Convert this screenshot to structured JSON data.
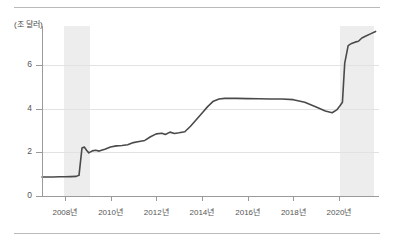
{
  "figure": {
    "unit_label": "(조 달러)",
    "top_rule": true,
    "bottom_rule": true
  },
  "chart_data": {
    "type": "line",
    "title": "",
    "subtitle": "",
    "xlabel": "",
    "ylabel": "(조 달러)",
    "unit": "조 달러",
    "grid": true,
    "legend": "none",
    "xlim": [
      2007.0,
      2021.75
    ],
    "ylim": [
      0,
      7.8
    ],
    "yticks": [
      0,
      2,
      4,
      6
    ],
    "ytick_labels": [
      "0",
      "2",
      "4",
      "6"
    ],
    "xticks": [
      2008,
      2010,
      2012,
      2014,
      2016,
      2018,
      2020
    ],
    "xtick_labels": [
      "2008년",
      "2010년",
      "2012년",
      "2014년",
      "2016년",
      "2018년",
      "2020년"
    ],
    "line_color": "#4a4a4a",
    "line_width": 1.6,
    "shaded_bands": [
      {
        "name": "recession-2008",
        "x_start": 2007.95,
        "x_end": 2009.1,
        "color": "#ededed"
      },
      {
        "name": "recession-2020",
        "x_start": 2020.05,
        "x_end": 2021.55,
        "color": "#ededed"
      }
    ],
    "series": [
      {
        "name": "연준 총자산",
        "x": [
          2007.0,
          2007.25,
          2007.5,
          2007.75,
          2008.0,
          2008.25,
          2008.5,
          2008.62,
          2008.75,
          2008.85,
          2008.95,
          2009.05,
          2009.2,
          2009.35,
          2009.5,
          2009.75,
          2010.0,
          2010.25,
          2010.5,
          2010.75,
          2011.0,
          2011.25,
          2011.5,
          2011.75,
          2012.0,
          2012.25,
          2012.4,
          2012.6,
          2012.8,
          2013.0,
          2013.25,
          2013.5,
          2013.75,
          2014.0,
          2014.25,
          2014.5,
          2014.75,
          2015.0,
          2015.5,
          2016.0,
          2016.5,
          2017.0,
          2017.5,
          2018.0,
          2018.5,
          2019.0,
          2019.4,
          2019.7,
          2019.9,
          2020.05,
          2020.15,
          2020.25,
          2020.4,
          2020.55,
          2020.7,
          2020.85,
          2021.0,
          2021.2,
          2021.4,
          2021.6
        ],
        "y": [
          0.87,
          0.87,
          0.87,
          0.88,
          0.88,
          0.89,
          0.9,
          0.95,
          2.2,
          2.25,
          2.1,
          1.98,
          2.07,
          2.1,
          2.06,
          2.15,
          2.25,
          2.3,
          2.32,
          2.35,
          2.45,
          2.5,
          2.55,
          2.72,
          2.85,
          2.88,
          2.82,
          2.93,
          2.87,
          2.9,
          2.95,
          3.2,
          3.5,
          3.8,
          4.1,
          4.35,
          4.45,
          4.48,
          4.48,
          4.47,
          4.46,
          4.45,
          4.45,
          4.42,
          4.3,
          4.08,
          3.9,
          3.82,
          3.95,
          4.15,
          4.3,
          6.1,
          6.9,
          7.0,
          7.06,
          7.1,
          7.25,
          7.35,
          7.45,
          7.55
        ]
      }
    ],
    "annotations": []
  }
}
